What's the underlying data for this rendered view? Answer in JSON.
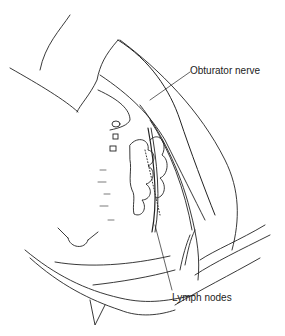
{
  "figure": {
    "labels": [
      {
        "text": "Obturator nerve",
        "x": 190,
        "y": 65
      },
      {
        "text": "Lymph nodes",
        "x": 172,
        "y": 292
      }
    ],
    "line_color": "#222222",
    "background": "#ffffff"
  }
}
